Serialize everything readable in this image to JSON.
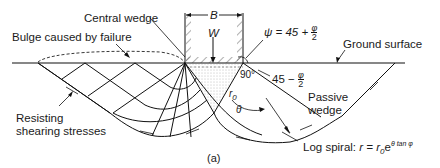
{
  "figure": {
    "panel_label": "(a)",
    "labels": {
      "central_wedge": "Central wedge",
      "bulge": "Bulge caused by failure",
      "ground_surface": "Ground surface",
      "passive_wedge_line1": "Passive",
      "passive_wedge_line2": "wedge",
      "resisting_line1": "Resisting",
      "resisting_line2": "shearing stresses",
      "log_spiral": "Log spiral: ",
      "footing_width": "B",
      "load": "W",
      "psi_lhs": "ψ = 45 + ",
      "phi": "φ",
      "two": "2",
      "angle_45": "45 − ",
      "angle_90": "90°",
      "r0": "r",
      "r0_sub": "0",
      "theta": "θ"
    },
    "log_spiral_formula": {
      "r": "r = ",
      "r0": "r",
      "r0_sub": "0",
      "e": "e",
      "exp": "θ tan φ"
    }
  }
}
